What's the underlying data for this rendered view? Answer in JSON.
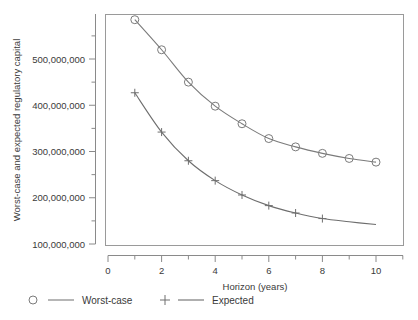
{
  "chart_data": {
    "type": "line",
    "title": "",
    "subtitle": "",
    "xlabel": "Horizon (years)",
    "ylabel": "Worst-case and expected regulatory capital",
    "x": [
      1,
      2,
      3,
      4,
      5,
      6,
      7,
      8,
      9,
      10
    ],
    "xlim": [
      0,
      11
    ],
    "ylim": [
      100000000,
      600000000
    ],
    "grid": false,
    "legend_position": "below-axes",
    "x_ticks_major": [
      0,
      2,
      4,
      6,
      8,
      10
    ],
    "x_ticklabels": [
      "0",
      "2",
      "4",
      "6",
      "8",
      "10"
    ],
    "x_ticks_minor": [
      1,
      3,
      5,
      7,
      9,
      11
    ],
    "y_ticks_major": [
      100000000,
      200000000,
      300000000,
      400000000,
      500000000
    ],
    "y_ticklabels": [
      "100,000,000",
      "200,000,000",
      "300,000,000",
      "400,000,000",
      "500,000,000"
    ],
    "y_ticks_minor": [
      150000000,
      250000000,
      350000000,
      450000000,
      550000000
    ],
    "series": [
      {
        "name": "Worst-case",
        "marker": "circle",
        "color": "#7b7b7b",
        "values": [
          585000000,
          520000000,
          450000000,
          398000000,
          360000000,
          328000000,
          310000000,
          296000000,
          285000000,
          277000000
        ]
      },
      {
        "name": "Expected",
        "marker": "plus",
        "color": "#6e6e6e",
        "marker_x": [
          1,
          2,
          3,
          4,
          5,
          6,
          7,
          8
        ],
        "values": [
          427000000,
          342000000,
          280000000,
          237000000,
          206000000,
          183000000,
          167000000,
          155000000,
          148000000,
          142000000
        ]
      }
    ]
  },
  "legend": {
    "entries": [
      {
        "label": "Worst-case",
        "marker": "circle"
      },
      {
        "label": "Expected",
        "marker": "plus"
      }
    ]
  },
  "colors": {
    "line": "#7b7b7b",
    "axis": "#8a8a8a",
    "text": "#3a3a3a",
    "background": "#ffffff"
  }
}
